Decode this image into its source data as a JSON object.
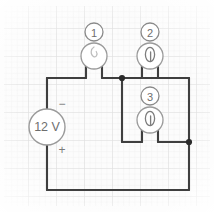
{
  "figure": {
    "name": "dc-circuit-diagram",
    "medium": "hand-drawn on graph paper",
    "width": 214,
    "height": 212
  },
  "colors": {
    "background": "#ffffff",
    "paper": "#fbfbfb",
    "grid_minor": "#eeeeee",
    "grid_major": "#e0e0e0",
    "wire": "#3f3f3f",
    "symbol_stroke": "#8a8a8a",
    "symbol_fill": "#ffffff",
    "node_dot": "#2b2b2b",
    "text": "#6e6e6e"
  },
  "source": {
    "name": "voltage-source",
    "label": "12 V",
    "polarity_top": "−",
    "polarity_bottom": "+",
    "cx": 47,
    "cy": 127,
    "r": 18
  },
  "components": [
    {
      "id": 1,
      "name": "component-1",
      "number_label": "1",
      "symbol": "loop-element-icon",
      "badge_cx": 94,
      "badge_cy": 32,
      "badge_r": 9,
      "body_cx": 94,
      "body_cy": 56,
      "body_r": 13
    },
    {
      "id": 2,
      "name": "component-2",
      "number_label": "2",
      "symbol": "loop-element-icon",
      "badge_cx": 150,
      "badge_cy": 32,
      "badge_r": 9,
      "body_cx": 150,
      "body_cy": 56,
      "body_r": 13
    },
    {
      "id": 3,
      "name": "component-3",
      "number_label": "3",
      "symbol": "loop-element-icon",
      "badge_cx": 150,
      "badge_cy": 96,
      "badge_r": 9,
      "body_cx": 150,
      "body_cy": 120,
      "body_r": 13
    }
  ],
  "nodes": [
    {
      "name": "node-top-junction",
      "x": 122,
      "y": 78,
      "r": 3
    },
    {
      "name": "node-right-junction",
      "x": 189,
      "y": 142,
      "r": 3
    }
  ],
  "wires": {
    "description": "12 V source on the left feeds a top rail to component 1; node at x=122 splits to components 2 and 3 in parallel, rejoining at the right node before the bottom return rail.",
    "segments": [
      {
        "name": "wire-source-top-to-rail",
        "points": "47,109 47,78"
      },
      {
        "name": "wire-top-rail-left",
        "points": "47,78 86,78"
      },
      {
        "name": "wire-comp1-left-lead",
        "points": "86,78 86,60"
      },
      {
        "name": "wire-comp1-right-lead",
        "points": "102,60 102,78"
      },
      {
        "name": "wire-top-rail-mid",
        "points": "102,78 189,78"
      },
      {
        "name": "wire-comp2-left-lead",
        "points": "142,78 142,60"
      },
      {
        "name": "wire-comp2-right-lead",
        "points": "158,60 158,78"
      },
      {
        "name": "wire-branch-left-down",
        "points": "122,78 122,142"
      },
      {
        "name": "wire-branch-bottom-left",
        "points": "122,142 142,142"
      },
      {
        "name": "wire-comp3-left-lead",
        "points": "142,142 142,124"
      },
      {
        "name": "wire-comp3-right-lead",
        "points": "158,124 158,142"
      },
      {
        "name": "wire-branch-bottom-right",
        "points": "158,142 189,142"
      },
      {
        "name": "wire-right-rail",
        "points": "189,78 189,190"
      },
      {
        "name": "wire-bottom-rail",
        "points": "189,190 47,190"
      },
      {
        "name": "wire-source-bottom-to-rail",
        "points": "47,190 47,145"
      }
    ]
  }
}
